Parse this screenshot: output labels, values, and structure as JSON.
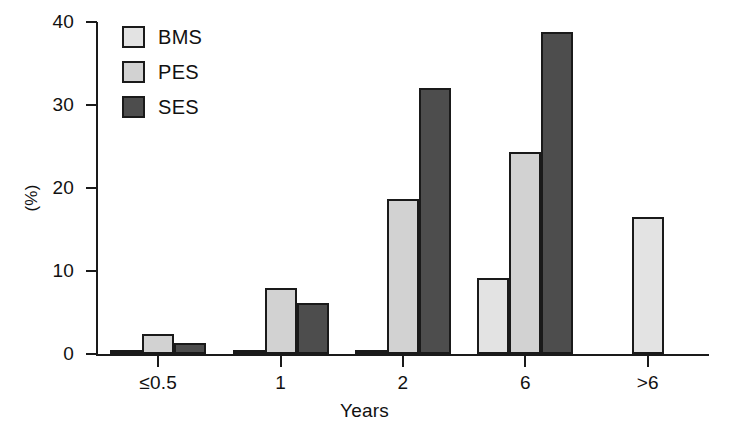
{
  "chart_data": {
    "type": "bar",
    "title": "",
    "xlabel": "Years",
    "ylabel": "(%)",
    "ylim": [
      0,
      40
    ],
    "yticks": [
      0,
      10,
      20,
      30,
      40
    ],
    "categories": [
      "≤0.5",
      "1",
      "2",
      "6",
      ">6"
    ],
    "grid": false,
    "legend_position": "top-left-inside",
    "series": [
      {
        "name": "BMS",
        "color": "#e3e3e3",
        "values": [
          0.4,
          0.5,
          0.4,
          9.2,
          16.5
        ]
      },
      {
        "name": "PES",
        "color": "#d2d2d2",
        "values": [
          2.4,
          8.0,
          18.7,
          24.3,
          null
        ]
      },
      {
        "name": "SES",
        "color": "#4d4d4d",
        "values": [
          1.3,
          6.2,
          32.0,
          38.8,
          null
        ]
      }
    ]
  },
  "axes": {
    "y_tick_labels": [
      "0",
      "10",
      "20",
      "30",
      "40"
    ],
    "y_axis_title": "(%)",
    "x_tick_labels": [
      "≤0.5",
      "1",
      "2",
      "6",
      ">6"
    ],
    "x_axis_title": "Years"
  },
  "legend": {
    "entries": [
      {
        "label": "BMS",
        "color": "#e3e3e3"
      },
      {
        "label": "PES",
        "color": "#d2d2d2"
      },
      {
        "label": "SES",
        "color": "#4d4d4d"
      }
    ]
  },
  "style": {
    "background": "#ffffff",
    "axis_color": "#1a1a1a",
    "bar_border": "#1a1a1a"
  }
}
